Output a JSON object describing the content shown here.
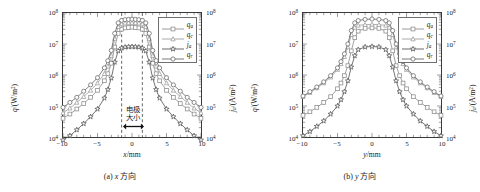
{
  "figure": {
    "panels": [
      {
        "id": "a",
        "caption_prefix": "(a)",
        "caption_var": "x",
        "caption_text": "方向",
        "xlabel_var": "x",
        "xlabel_unit": "/mm",
        "annotation_line1": "电极",
        "annotation_line2": "大小",
        "electrode_half_width_mm": 1.5,
        "has_electrode_marker": true
      },
      {
        "id": "b",
        "caption_prefix": "(b)",
        "caption_var": "y",
        "caption_text": "方向",
        "xlabel_var": "y",
        "xlabel_unit": "/mm",
        "annotation_line1": "",
        "annotation_line2": "",
        "electrode_half_width_mm": 0,
        "has_electrode_marker": false
      }
    ],
    "axes": {
      "ylabel_left_var": "q",
      "ylabel_left_unit": "/(W/m",
      "ylabel_left_sup": "2",
      "ylabel_right_var": "j",
      "ylabel_right_sub": "a",
      "ylabel_right_unit": "/(A/m",
      "ylabel_right_sup": "2",
      "xticks": [
        "−10",
        "−5",
        "0",
        "5",
        "10"
      ],
      "xtick_values": [
        -10,
        -5,
        0,
        5,
        10
      ],
      "ytick_exponents": [
        4,
        5,
        6,
        7,
        8
      ],
      "ytick_base": "10",
      "xlim": [
        -10,
        10
      ],
      "ylim_exp": [
        4,
        8
      ],
      "yscale": "log",
      "grid": false
    },
    "legend": {
      "position": "top-right",
      "entries": [
        {
          "var": "q",
          "sub": "a",
          "marker": "square",
          "color": "#8f8f8f"
        },
        {
          "var": "q",
          "sub": "c",
          "marker": "triangle",
          "color": "#9e9e9e"
        },
        {
          "var": "j",
          "sub": "a",
          "marker": "star",
          "color": "#5a5a5a"
        },
        {
          "var": "q",
          "sub": "r",
          "marker": "circle",
          "color": "#6b6b6b"
        }
      ]
    }
  },
  "chart_data": [
    {
      "type": "line",
      "title": "(a) x 方向",
      "xlabel": "x/mm",
      "ylabel": "q/(W/m^2)",
      "ylabel_right": "j_a/(A/m^2)",
      "xlim": [
        -10,
        10
      ],
      "ylim": [
        10000,
        100000000
      ],
      "yscale": "log",
      "grid": false,
      "annotations": [
        {
          "text": "电极大小",
          "x": 0,
          "note": "electrode size, arrow between dashed lines at x=±1.5 mm"
        }
      ],
      "vlines": [
        -1.5,
        1.5
      ],
      "x": [
        -10,
        -9,
        -8,
        -7,
        -6,
        -5,
        -4,
        -3.5,
        -3,
        -2.5,
        -2,
        -1.5,
        -1,
        -0.5,
        0,
        0.5,
        1,
        1.5,
        2,
        2.5,
        3,
        3.5,
        4,
        5,
        6,
        7,
        8,
        9,
        10
      ],
      "series": [
        {
          "name": "q_a",
          "marker": "square",
          "color": "#8f8f8f",
          "values": [
            40000.0,
            55000.0,
            80000.0,
            120000.0,
            190000.0,
            320000.0,
            650000.0,
            1100000.0,
            2400000.0,
            8000000.0,
            22000000.0,
            30000000.0,
            33000000.0,
            34000000.0,
            35000000.0,
            34000000.0,
            33000000.0,
            30000000.0,
            22000000.0,
            8000000.0,
            2400000.0,
            1100000.0,
            650000.0,
            320000.0,
            190000.0,
            120000.0,
            80000.0,
            55000.0,
            40000.0
          ]
        },
        {
          "name": "q_c",
          "marker": "triangle",
          "color": "#9e9e9e",
          "values": [
            60000.0,
            85000.0,
            130000.0,
            200000.0,
            320000.0,
            550000.0,
            1100000.0,
            1900000.0,
            4200000.0,
            15000000.0,
            36000000.0,
            44000000.0,
            47000000.0,
            48000000.0,
            49000000.0,
            48000000.0,
            47000000.0,
            44000000.0,
            36000000.0,
            15000000.0,
            4200000.0,
            1900000.0,
            1100000.0,
            550000.0,
            320000.0,
            200000.0,
            130000.0,
            85000.0,
            60000.0
          ]
        },
        {
          "name": "j_a",
          "marker": "star",
          "color": "#5a5a5a",
          "values": [
            8000.0,
            11000.0,
            17000.0,
            27000.0,
            45000.0,
            80000.0,
            180000.0,
            340000.0,
            800000.0,
            2600000.0,
            6000000.0,
            7400000.0,
            7900000.0,
            8100000.0,
            8200000.0,
            8100000.0,
            7900000.0,
            7400000.0,
            6000000.0,
            2600000.0,
            800000.0,
            340000.0,
            180000.0,
            80000.0,
            45000.0,
            27000.0,
            17000.0,
            11000.0,
            8000.0
          ]
        },
        {
          "name": "q_r",
          "marker": "circle",
          "color": "#6b6b6b",
          "values": [
            90000.0,
            130000.0,
            190000.0,
            300000.0,
            480000.0,
            820000.0,
            1700000.0,
            2900000.0,
            6200000.0,
            22000000.0,
            48000000.0,
            58000000.0,
            61000000.0,
            62000000.0,
            63000000.0,
            62000000.0,
            61000000.0,
            58000000.0,
            48000000.0,
            22000000.0,
            6200000.0,
            2900000.0,
            1700000.0,
            820000.0,
            480000.0,
            300000.0,
            190000.0,
            130000.0,
            90000.0
          ]
        }
      ]
    },
    {
      "type": "line",
      "title": "(b) y 方向",
      "xlabel": "y/mm",
      "ylabel": "q/(W/m^2)",
      "ylabel_right": "j_a/(A/m^2)",
      "xlim": [
        -10,
        10
      ],
      "ylim": [
        10000,
        100000000
      ],
      "yscale": "log",
      "grid": false,
      "annotations": [],
      "vlines": [],
      "x": [
        -10,
        -9,
        -8,
        -7,
        -6,
        -5,
        -4.5,
        -4,
        -3.5,
        -3,
        -2.5,
        -2,
        -1,
        0,
        1,
        2,
        2.5,
        3,
        3.5,
        4,
        4.5,
        5,
        6,
        7,
        8,
        9,
        10
      ],
      "series": [
        {
          "name": "q_a",
          "marker": "square",
          "color": "#8f8f8f",
          "values": [
            50000.0,
            65000.0,
            90000.0,
            130000.0,
            200000.0,
            360000.0,
            550000.0,
            950000.0,
            2000000.0,
            6000000.0,
            16000000.0,
            26000000.0,
            32000000.0,
            33000000.0,
            32000000.0,
            26000000.0,
            16000000.0,
            6000000.0,
            2000000.0,
            950000.0,
            550000.0,
            360000.0,
            200000.0,
            130000.0,
            90000.0,
            65000.0,
            50000.0
          ]
        },
        {
          "name": "q_c",
          "marker": "triangle",
          "color": "#9e9e9e",
          "values": [
            200000.0,
            270000.0,
            380000.0,
            550000.0,
            850000.0,
            1500000.0,
            2300000.0,
            3900000.0,
            8000000.0,
            20000000.0,
            34000000.0,
            40000000.0,
            42000000.0,
            43000000.0,
            42000000.0,
            40000000.0,
            34000000.0,
            20000000.0,
            8000000.0,
            3900000.0,
            2300000.0,
            1500000.0,
            850000.0,
            550000.0,
            380000.0,
            270000.0,
            200000.0
          ]
        },
        {
          "name": "j_a",
          "marker": "star",
          "color": "#5a5a5a",
          "values": [
            11000.0,
            15000.0,
            22000.0,
            33000.0,
            55000.0,
            100000.0,
            160000.0,
            290000.0,
            650000.0,
            1800000.0,
            4200000.0,
            6600000.0,
            8000000.0,
            8300000.0,
            8000000.0,
            6600000.0,
            4200000.0,
            1800000.0,
            650000.0,
            290000.0,
            160000.0,
            100000.0,
            55000.0,
            33000.0,
            22000.0,
            15000.0,
            11000.0
          ]
        },
        {
          "name": "q_r",
          "marker": "circle",
          "color": "#6b6b6b",
          "values": [
            210000.0,
            290000.0,
            410000.0,
            600000.0,
            950000.0,
            1700000.0,
            2700000.0,
            4800000.0,
            10000000.0,
            27000000.0,
            48000000.0,
            57000000.0,
            62000000.0,
            64000000.0,
            62000000.0,
            57000000.0,
            48000000.0,
            27000000.0,
            10000000.0,
            4800000.0,
            2700000.0,
            1700000.0,
            950000.0,
            600000.0,
            410000.0,
            290000.0,
            210000.0
          ]
        }
      ]
    }
  ]
}
